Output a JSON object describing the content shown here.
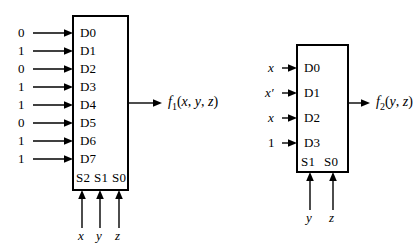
{
  "figure": {
    "background_color": "#ffffff",
    "line_color": "#000000"
  },
  "diagrams": [
    {
      "id": "mux8to1",
      "name": "8-to-1 multiplexer",
      "data_inputs": [
        {
          "port": "D0",
          "value": "0"
        },
        {
          "port": "D1",
          "value": "1"
        },
        {
          "port": "D2",
          "value": "0"
        },
        {
          "port": "D3",
          "value": "1"
        },
        {
          "port": "D4",
          "value": "1"
        },
        {
          "port": "D5",
          "value": "0"
        },
        {
          "port": "D6",
          "value": "1"
        },
        {
          "port": "D7",
          "value": "1"
        }
      ],
      "select_ports": [
        "S2",
        "S1",
        "S0"
      ],
      "select_inputs": [
        "x",
        "y",
        "z"
      ],
      "output": {
        "name": "f",
        "subscript": "1",
        "args": [
          "x",
          "y",
          "z"
        ],
        "text": "f1(x, y, z)"
      }
    },
    {
      "id": "mux4to1",
      "name": "4-to-1 multiplexer",
      "data_inputs": [
        {
          "port": "D0",
          "value": "x"
        },
        {
          "port": "D1",
          "value": "x′"
        },
        {
          "port": "D2",
          "value": "x"
        },
        {
          "port": "D3",
          "value": "1"
        }
      ],
      "select_ports": [
        "S1",
        "S0"
      ],
      "select_inputs": [
        "y",
        "z"
      ],
      "output": {
        "name": "f",
        "subscript": "2",
        "args": [
          "y",
          "z"
        ],
        "text": "f2(y, z)"
      }
    }
  ]
}
